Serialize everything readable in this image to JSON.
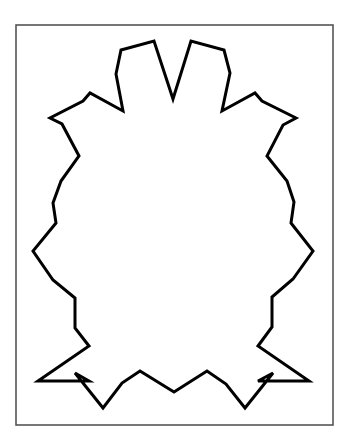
{
  "figure": {
    "background": "#ffffff",
    "frame": {
      "x": 16,
      "y": 25,
      "width": 317,
      "height": 400,
      "stroke": "#555555",
      "stroke_width": 1.6
    },
    "shape": {
      "stroke": "#000000",
      "stroke_width": 3,
      "points": [
        [
          121,
          50
        ],
        [
          154,
          41
        ],
        [
          173,
          99
        ],
        [
          191,
          41
        ],
        [
          224,
          50
        ],
        [
          230,
          73
        ],
        [
          222,
          111
        ],
        [
          255,
          93
        ],
        [
          262,
          101
        ],
        [
          296,
          118
        ],
        [
          283,
          125
        ],
        [
          267,
          156
        ],
        [
          287,
          181
        ],
        [
          294,
          202
        ],
        [
          291,
          223
        ],
        [
          313,
          251
        ],
        [
          293,
          279
        ],
        [
          272,
          297
        ],
        [
          272,
          327
        ],
        [
          258,
          346
        ],
        [
          309,
          381
        ],
        [
          258,
          381
        ],
        [
          273,
          373
        ],
        [
          245,
          408
        ],
        [
          226,
          384
        ],
        [
          207,
          371
        ],
        [
          174,
          392
        ],
        [
          140,
          371
        ],
        [
          122,
          383
        ],
        [
          103,
          408
        ],
        [
          75,
          373
        ],
        [
          89,
          381
        ],
        [
          38,
          381
        ],
        [
          89,
          346
        ],
        [
          75,
          328
        ],
        [
          75,
          298
        ],
        [
          53,
          280
        ],
        [
          33,
          251
        ],
        [
          56,
          223
        ],
        [
          53,
          203
        ],
        [
          61,
          181
        ],
        [
          79,
          156
        ],
        [
          62,
          124
        ],
        [
          50,
          118
        ],
        [
          83,
          101
        ],
        [
          90,
          93
        ],
        [
          123,
          111
        ],
        [
          116,
          74
        ]
      ]
    }
  }
}
